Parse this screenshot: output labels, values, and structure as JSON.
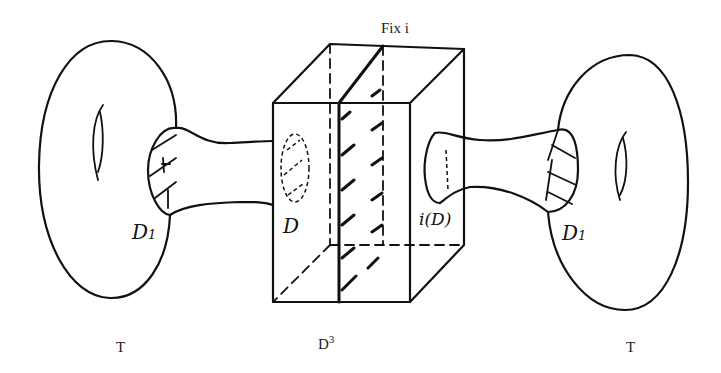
{
  "diagram": {
    "labels": {
      "fix_i": "Fix i",
      "left_torus": "T",
      "right_torus": "T",
      "ball": "D",
      "ball_exponent": "3",
      "disk_D": "D",
      "disk_iD": "i(D)",
      "left_disk": "D",
      "left_disk_sub": "1",
      "right_disk": "D",
      "right_disk_sub": "1"
    },
    "elements": [
      {
        "id": "left-torus",
        "type": "torus",
        "label": "T"
      },
      {
        "id": "left-tube",
        "type": "tube",
        "connects": [
          "D1",
          "D"
        ]
      },
      {
        "id": "ball",
        "type": "cube",
        "label": "D3"
      },
      {
        "id": "fixed-plane",
        "type": "plane",
        "label": "Fix i"
      },
      {
        "id": "right-tube",
        "type": "tube",
        "connects": [
          "i(D)",
          "D1"
        ]
      },
      {
        "id": "right-torus",
        "type": "torus",
        "label": "T"
      }
    ],
    "colors": {
      "ink": "#111111",
      "background": "#ffffff"
    }
  }
}
